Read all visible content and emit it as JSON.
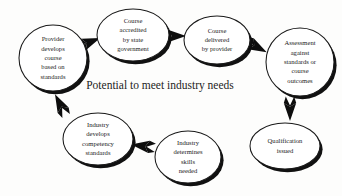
{
  "diagram": {
    "title": "Potential to meet industry needs",
    "caption": {
      "text": "Potential to meet industry needs",
      "x": 160,
      "y": 89,
      "font_size": 11.5
    },
    "canvas": {
      "width": 342,
      "height": 196,
      "background": "#fdfdfc"
    },
    "style": {
      "ellipse_fill": "#ffffff",
      "ellipse_stroke": "#1a1a1a",
      "shadow_color": "#111111",
      "arrow_color": "#0d0d0d",
      "label_color": "#222222",
      "label_font_size": 6.6
    },
    "nodes": [
      {
        "id": "provider-develops-course",
        "name": "provider-develops-course-based-on-standards",
        "lines": [
          "Provider",
          "develops",
          "course",
          "based on",
          "standards"
        ],
        "cx": 53,
        "cy": 58,
        "rx": 34,
        "ry": 33
      },
      {
        "id": "course-accredited",
        "name": "course-accredited-by-state-government",
        "lines": [
          "Course",
          "accredited",
          "by state",
          "government"
        ],
        "cx": 133,
        "cy": 35,
        "rx": 36,
        "ry": 26
      },
      {
        "id": "course-delivered",
        "name": "course-delivered-by-provider",
        "lines": [
          "Course",
          "delivered",
          "by provider"
        ],
        "cx": 217,
        "cy": 40,
        "rx": 33,
        "ry": 24
      },
      {
        "id": "assessment-against-standards",
        "name": "assessment-against-standards-or-course-outcomes",
        "lines": [
          "Assessment",
          "against",
          "standards or",
          "course",
          "outcomes"
        ],
        "cx": 300,
        "cy": 62,
        "rx": 34,
        "ry": 34
      },
      {
        "id": "qualification-issued",
        "name": "qualification-issued",
        "lines": [
          "Qualification",
          "issued"
        ],
        "cx": 285,
        "cy": 146,
        "rx": 35,
        "ry": 23
      },
      {
        "id": "industry-determines-skills",
        "name": "industry-determines-skills-needed",
        "lines": [
          "Industry",
          "determines",
          "skills",
          "needed"
        ],
        "cx": 188,
        "cy": 157,
        "rx": 33,
        "ry": 26
      },
      {
        "id": "industry-develops-competency",
        "name": "industry-develops-competency-standards",
        "lines": [
          "Industry",
          "develops",
          "competency",
          "standards"
        ],
        "cx": 98,
        "cy": 139,
        "rx": 35,
        "ry": 26
      }
    ],
    "arrows": [
      {
        "id": "arrow-provider-to-accredited",
        "name": "arrow-provider-to-accredited",
        "from": "provider-develops-course",
        "to": "course-accredited",
        "x": 90,
        "y": 42,
        "angle": -22,
        "scale": 1.0
      },
      {
        "id": "arrow-accredited-to-delivered",
        "name": "arrow-accredited-to-delivered",
        "from": "course-accredited",
        "to": "course-delivered",
        "x": 175,
        "y": 36,
        "angle": 0,
        "scale": 1.0
      },
      {
        "id": "arrow-delivered-to-assessment",
        "name": "arrow-delivered-to-assessment",
        "from": "course-delivered",
        "to": "assessment-against-standards",
        "x": 257,
        "y": 47,
        "angle": 28,
        "scale": 1.0
      },
      {
        "id": "arrow-assessment-to-qualification",
        "name": "arrow-assessment-to-qualification",
        "from": "assessment-against-standards",
        "to": "qualification-issued",
        "x": 290,
        "y": 110,
        "angle": 90,
        "scale": 1.0
      },
      {
        "id": "arrow-skills-to-competency",
        "name": "arrow-determines-to-develops",
        "from": "industry-determines-skills",
        "to": "industry-develops-competency",
        "x": 142,
        "y": 146,
        "angle": 188,
        "scale": 1.0
      },
      {
        "id": "arrow-competency-to-provider",
        "name": "arrow-develops-to-provider",
        "from": "industry-develops-competency",
        "to": "provider-develops-course",
        "x": 60,
        "y": 104,
        "angle": 243,
        "scale": 1.0
      }
    ]
  }
}
